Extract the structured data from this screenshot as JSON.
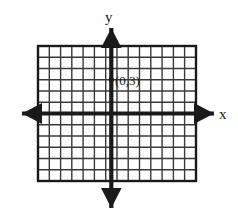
{
  "figure": {
    "kind": "cartesian-coordinate-grid",
    "background_color": "#ffffff",
    "ink_color": "#1a1a1a",
    "grid_line_color": "#3a3a3a"
  },
  "axes": {
    "x_axis": {
      "label": "x",
      "orientation": "horizontal",
      "arrow_left": true,
      "arrow_right": true
    },
    "y_axis": {
      "label": "y",
      "orientation": "vertical",
      "arrow_up": true,
      "arrow_down": true
    }
  },
  "grid": {
    "columns": 14,
    "rows": 12,
    "cell_size_px": 11.25,
    "origin_column_index": 6,
    "origin_row_index": 6,
    "left_px": 38,
    "top_px": 46,
    "right_px": 196,
    "bottom_px": 181
  },
  "points": [
    {
      "label": "(0,3)",
      "x": 0,
      "y": 3,
      "marker": "dot"
    }
  ]
}
